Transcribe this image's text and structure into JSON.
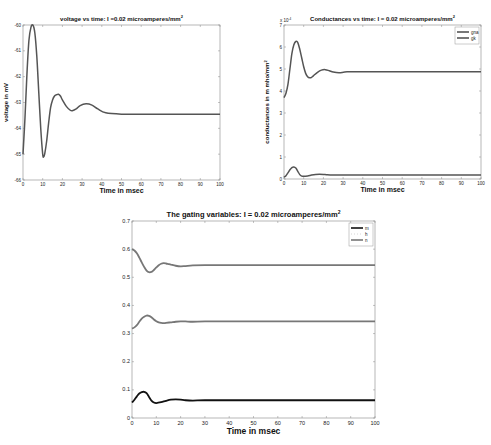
{
  "chart_data": [
    {
      "type": "line",
      "title": "voltage vs time: I =0.02 microamperes/mm",
      "title_superscript": "2",
      "xlabel": "Time in msec",
      "ylabel": "voltage in mV",
      "xlim": [
        0,
        100
      ],
      "ylim": [
        -66,
        -60
      ],
      "xticks": [
        "0",
        "10",
        "20",
        "30",
        "40",
        "50",
        "60",
        "70",
        "80",
        "90",
        "100"
      ],
      "yticks": [
        "-66",
        "-65",
        "-64",
        "-63",
        "-62",
        "-61",
        "-60"
      ],
      "grid": false,
      "series": [
        {
          "name": "V",
          "color": "#555555",
          "x": [
            0,
            1,
            2,
            3,
            4,
            5,
            6,
            7,
            8,
            9,
            10,
            10.5,
            11,
            12,
            13,
            14,
            15,
            16,
            17,
            18,
            19,
            20,
            22,
            24,
            25,
            27,
            29,
            32,
            35,
            38,
            42,
            50,
            60,
            70,
            80,
            90,
            100
          ],
          "y": [
            -65.0,
            -63.6,
            -61.9,
            -60.6,
            -60.1,
            -60.0,
            -60.3,
            -61.2,
            -62.6,
            -64.0,
            -65.0,
            -65.1,
            -65.0,
            -64.5,
            -63.8,
            -63.2,
            -62.9,
            -62.75,
            -62.7,
            -62.68,
            -62.75,
            -62.9,
            -63.15,
            -63.3,
            -63.32,
            -63.25,
            -63.12,
            -63.05,
            -63.1,
            -63.25,
            -63.4,
            -63.45,
            -63.45,
            -63.45,
            -63.45,
            -63.45,
            -63.45
          ]
        }
      ]
    },
    {
      "type": "line",
      "title": "Conductances vs time: I = 0.02 microamperes/mm",
      "title_superscript": "2",
      "xlabel": "Time in msec",
      "ylabel": "conductances in m mho/mm",
      "ylabel_superscript": "2",
      "y_multiplier": "x 10^-4",
      "xlim": [
        0,
        100
      ],
      "ylim": [
        0,
        7
      ],
      "xticks": [
        "0",
        "10",
        "20",
        "30",
        "40",
        "50",
        "60",
        "70",
        "80",
        "90",
        "100"
      ],
      "yticks": [
        "0",
        "1",
        "2",
        "3",
        "4",
        "5",
        "6",
        "7"
      ],
      "legend": [
        "gna",
        "gk"
      ],
      "legend_position": "upper right",
      "grid": false,
      "series": [
        {
          "name": "gna",
          "color": "#555555",
          "x": [
            0,
            1,
            2,
            3,
            4,
            5,
            6,
            7,
            8,
            9,
            10,
            12,
            14,
            16,
            18,
            20,
            22,
            25,
            30,
            40,
            60,
            80,
            100
          ],
          "y": [
            0.08,
            0.15,
            0.28,
            0.42,
            0.52,
            0.55,
            0.5,
            0.35,
            0.2,
            0.13,
            0.12,
            0.14,
            0.18,
            0.21,
            0.22,
            0.21,
            0.19,
            0.18,
            0.18,
            0.18,
            0.18,
            0.18,
            0.18
          ]
        },
        {
          "name": "gk",
          "color": "#555555",
          "x": [
            0,
            1,
            2,
            3,
            4,
            5,
            6,
            7,
            8,
            9,
            10,
            11,
            12,
            13,
            14,
            15,
            17,
            19,
            21,
            23,
            25,
            28,
            32,
            40,
            60,
            80,
            100
          ],
          "y": [
            3.7,
            3.9,
            4.3,
            5.0,
            5.7,
            6.1,
            6.25,
            6.2,
            5.9,
            5.5,
            5.1,
            4.8,
            4.65,
            4.6,
            4.62,
            4.7,
            4.85,
            4.95,
            4.97,
            4.92,
            4.86,
            4.83,
            4.87,
            4.88,
            4.88,
            4.88,
            4.88
          ]
        }
      ]
    },
    {
      "type": "line",
      "title": "The gating variables: I = 0.02 microamperes/mm",
      "title_superscript": "2",
      "xlabel": "Time in msec",
      "ylabel": "",
      "xlim": [
        0,
        100
      ],
      "ylim": [
        0,
        0.7
      ],
      "xticks": [
        "0",
        "10",
        "20",
        "30",
        "40",
        "50",
        "60",
        "70",
        "80",
        "90",
        "100"
      ],
      "yticks": [
        "0",
        "0.1",
        "0.2",
        "0.3",
        "0.4",
        "0.5",
        "0.6",
        "0.7"
      ],
      "legend": [
        "m",
        "h",
        "n"
      ],
      "legend_position": "upper right",
      "grid": false,
      "series": [
        {
          "name": "m",
          "color": "#111111",
          "x": [
            0,
            1,
            2,
            3,
            4,
            5,
            6,
            7,
            8,
            9,
            10,
            12,
            14,
            16,
            18,
            20,
            22,
            25,
            30,
            40,
            60,
            80,
            100
          ],
          "y": [
            0.055,
            0.065,
            0.077,
            0.087,
            0.092,
            0.093,
            0.088,
            0.075,
            0.062,
            0.055,
            0.053,
            0.056,
            0.061,
            0.065,
            0.066,
            0.065,
            0.063,
            0.062,
            0.063,
            0.063,
            0.063,
            0.063,
            0.063
          ]
        },
        {
          "name": "h",
          "color": "#777777",
          "x": [
            0,
            1,
            2,
            3,
            4,
            5,
            6,
            7,
            8,
            9,
            10,
            11,
            12,
            13,
            14,
            15,
            16,
            18,
            20,
            22,
            25,
            30,
            40,
            60,
            80,
            100
          ],
          "y": [
            0.6,
            0.595,
            0.585,
            0.57,
            0.553,
            0.537,
            0.524,
            0.518,
            0.519,
            0.526,
            0.535,
            0.543,
            0.548,
            0.55,
            0.549,
            0.547,
            0.545,
            0.541,
            0.539,
            0.54,
            0.542,
            0.543,
            0.543,
            0.543,
            0.543,
            0.543
          ]
        },
        {
          "name": "n",
          "color": "#777777",
          "x": [
            0,
            1,
            2,
            3,
            4,
            5,
            6,
            7,
            8,
            9,
            10,
            11,
            12,
            13,
            14,
            16,
            18,
            20,
            22,
            25,
            30,
            40,
            60,
            80,
            100
          ],
          "y": [
            0.318,
            0.322,
            0.33,
            0.342,
            0.353,
            0.36,
            0.364,
            0.363,
            0.358,
            0.35,
            0.344,
            0.34,
            0.338,
            0.337,
            0.338,
            0.34,
            0.342,
            0.343,
            0.343,
            0.342,
            0.343,
            0.343,
            0.343,
            0.343,
            0.343
          ]
        }
      ]
    }
  ],
  "layout": {
    "plots": [
      {
        "left": 23,
        "top": 25,
        "right": 220,
        "bottom": 180
      },
      {
        "left": 284,
        "top": 25,
        "right": 481,
        "bottom": 179
      },
      {
        "left": 132,
        "top": 221,
        "right": 375,
        "bottom": 418
      }
    ]
  }
}
